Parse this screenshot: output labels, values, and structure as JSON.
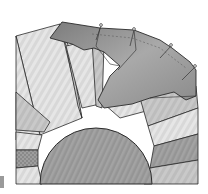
{
  "figure": {
    "colors": {
      "background": "#ffffff",
      "outline": "#2a2a2a",
      "center_circle": "#9c9c9c",
      "light_wedge": "#dedede",
      "mid_wedge": "#c4c4c4",
      "dark_wedge": "#a8a8a8",
      "border_fabric": "#8f8f8f",
      "border_fabric_light": "#b0b0b0",
      "pin_head": "#f0f0f0",
      "checked_wedge": "#8a8a8a"
    },
    "pins": [
      {
        "x": 101,
        "y": 26
      },
      {
        "x": 134,
        "y": 30
      },
      {
        "x": 171,
        "y": 46
      },
      {
        "x": 195,
        "y": 67
      }
    ]
  }
}
